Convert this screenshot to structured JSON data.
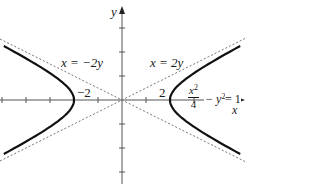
{
  "diagram": {
    "type": "hyperbola-plot",
    "equation": {
      "numerator": "x",
      "numerator_exp": "2",
      "denominator": "4",
      "minus_term": "− y",
      "minus_exp": "2",
      "equals": "= 1"
    },
    "axes": {
      "x_label": "x",
      "y_label": "y",
      "unit_px": 24,
      "origin_px": [
        122,
        100
      ],
      "x_ticks": [
        -5,
        -4,
        -3,
        -2,
        -1,
        1,
        2,
        3,
        4,
        5
      ],
      "y_ticks": [
        -3,
        -2,
        -1,
        1,
        2,
        3
      ]
    },
    "vertex_labels": {
      "left": "−2",
      "right": "2"
    },
    "asymptote_labels": {
      "left": "x = −2y",
      "right": "x = 2y"
    },
    "colors": {
      "curve": "#111111",
      "axis": "#555555",
      "asymptote": "#666666",
      "text": "#1a1a1a"
    }
  }
}
